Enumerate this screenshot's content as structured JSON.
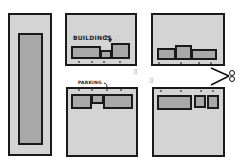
{
  "diagram": {
    "type": "site-layout-sketch",
    "colors": {
      "background": "#ffffff",
      "panel": "#d4d4d4",
      "building": "#a8a8a8",
      "outline": "#1a1a1a"
    },
    "labels": {
      "buildings": "BUILDINGS",
      "parking": "PARKING"
    },
    "panels": [
      {
        "id": "strip",
        "description": "tall narrow lot with single long building"
      },
      {
        "id": "top-middle",
        "description": "lot with buildings along bottom edge"
      },
      {
        "id": "top-right",
        "description": "lot with buildings along bottom edge"
      },
      {
        "id": "bottom-middle",
        "description": "lot with buildings along top edge, parking below"
      },
      {
        "id": "bottom-right",
        "description": "lot with buildings along top edge after cut"
      }
    ],
    "icons": {
      "cut": "scissors-icon"
    }
  }
}
